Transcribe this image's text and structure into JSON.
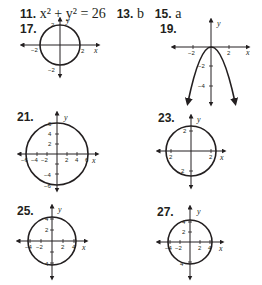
{
  "answers_line": {
    "items": [
      {
        "number": "11.",
        "answer": "x² + y² = 26"
      },
      {
        "number": "13.",
        "answer": "b"
      },
      {
        "number": "15.",
        "answer": "a"
      }
    ]
  },
  "graphs": [
    {
      "number": "17.",
      "type": "circle",
      "equation_radius": 2,
      "x_label": "x",
      "y_label": "y",
      "x_ticks": [
        "−2",
        "2"
      ],
      "y_ticks": [
        "2",
        "−2"
      ]
    },
    {
      "number": "19.",
      "type": "parabola",
      "x_label": "x",
      "y_label": "y",
      "x_ticks": [
        "−2",
        "2"
      ],
      "y_ticks": [
        "−2",
        "−4"
      ]
    },
    {
      "number": "21.",
      "type": "circle",
      "equation_radius": 6,
      "x_label": "x",
      "y_label": "y",
      "x_ticks": [
        "−6",
        "−4",
        "−2",
        "2",
        "4",
        "6"
      ],
      "y_ticks": [
        "6",
        "4",
        "2",
        "−4",
        "−6"
      ]
    },
    {
      "number": "23.",
      "type": "circle",
      "x_label": "x",
      "y_label": "y",
      "x_ticks": [
        "2",
        "2"
      ],
      "y_ticks": [
        "2",
        "2"
      ]
    },
    {
      "number": "25.",
      "type": "circle",
      "equation_radius": 4,
      "x_label": "x",
      "y_label": "y",
      "x_ticks": [
        "−4",
        "−2",
        "2",
        "4"
      ],
      "y_ticks": [
        "4",
        "2",
        "4"
      ]
    },
    {
      "number": "27.",
      "type": "circle",
      "x_label": "x",
      "y_label": "y",
      "x_ticks": [
        "−4",
        "−2",
        "2",
        "4"
      ],
      "y_ticks": [
        "4",
        "2",
        "4"
      ]
    }
  ],
  "colors": {
    "ink": "#231f20",
    "background": "#ffffff"
  }
}
